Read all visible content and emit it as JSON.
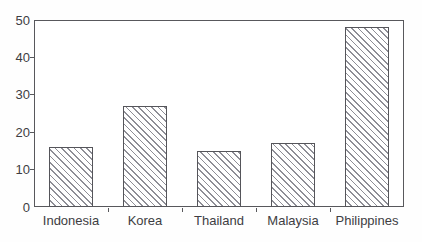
{
  "chart_data": {
    "type": "bar",
    "categories": [
      "Indonesia",
      "Korea",
      "Thailand",
      "Malaysia",
      "Philippines"
    ],
    "values": [
      16,
      27,
      15,
      17,
      48
    ],
    "title": "",
    "xlabel": "",
    "ylabel": "",
    "ylim": [
      0,
      50
    ],
    "yticks": [
      0,
      10,
      20,
      30,
      40,
      50
    ],
    "grid": false,
    "legend": null,
    "bar_style": "diagonal-hatch",
    "colors": {
      "frame": "#58585c",
      "bar_border": "#55555a",
      "hatch_line": "#8e8e96",
      "plot_background": "#ffffff",
      "text": "#3d3d42"
    }
  }
}
